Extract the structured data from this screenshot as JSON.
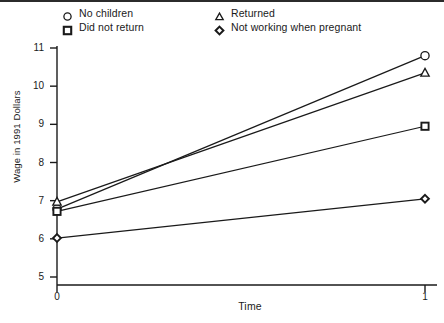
{
  "chart_data": {
    "type": "line",
    "title": "",
    "xlabel": "Time",
    "ylabel": "Wage in 1991 Dollars",
    "x": [
      0,
      1
    ],
    "xlim": [
      0,
      1
    ],
    "ylim": [
      5,
      11
    ],
    "xticks": [
      "0",
      "1"
    ],
    "yticks": [
      "5",
      "6",
      "7",
      "8",
      "9",
      "10",
      "11"
    ],
    "grid": false,
    "legend_position": "top",
    "series": [
      {
        "name": "No children",
        "marker": "circle",
        "values": [
          6.78,
          10.8
        ]
      },
      {
        "name": "Did not return",
        "marker": "square",
        "values": [
          6.72,
          8.95
        ]
      },
      {
        "name": "Returned",
        "marker": "triangle",
        "values": [
          6.97,
          10.35
        ]
      },
      {
        "name": "Not working when pregnant",
        "marker": "diamond",
        "values": [
          6.02,
          7.05
        ]
      }
    ]
  },
  "legend": {
    "items": [
      {
        "label": "No children",
        "marker": "circle"
      },
      {
        "label": "Did not return",
        "marker": "square"
      },
      {
        "label": "Returned",
        "marker": "triangle"
      },
      {
        "label": "Not working when pregnant",
        "marker": "diamond"
      }
    ]
  },
  "colors": {
    "ink": "#1a1a1a",
    "background": "#ffffff"
  }
}
